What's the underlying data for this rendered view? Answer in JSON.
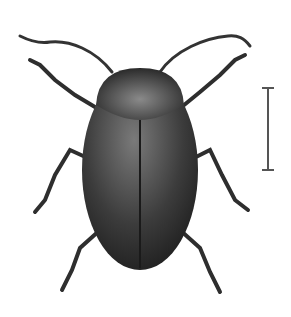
{
  "image": {
    "subject": "beetle illustration",
    "background": "#ffffff",
    "body_color": "#3a3a3a",
    "scale_bar": {
      "orientation": "vertical",
      "x": 268,
      "y_top": 88,
      "y_bottom": 170
    }
  }
}
